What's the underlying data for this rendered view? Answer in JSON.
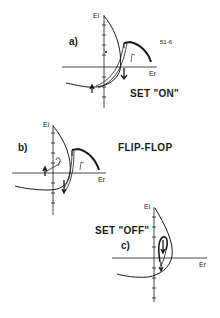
{
  "figure": {
    "code": "51-6",
    "panels": [
      {
        "id": "a",
        "label": "a)",
        "title": "SET \"ON\"",
        "y_axis": "Ei",
        "x_axis": "Er"
      },
      {
        "id": "b",
        "label": "b)",
        "title": "FLIP-FLOP",
        "y_axis": "Ei",
        "x_axis": "Er"
      },
      {
        "id": "c",
        "label": "c)",
        "title": "SET \"OFF\"",
        "y_axis": "Ei",
        "x_axis": "Er"
      }
    ],
    "colors": {
      "ink": "#1a1a1a",
      "background": "#ffffff"
    }
  }
}
